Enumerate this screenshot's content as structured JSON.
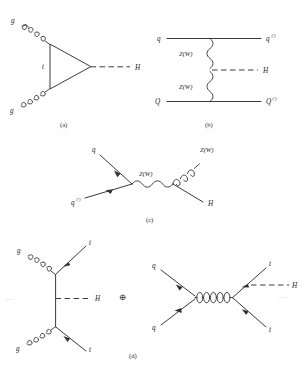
{
  "figure": {
    "background_color": "#ffffff",
    "line_color": "#303030",
    "text_color": "#262626",
    "width": 307,
    "height": 376
  },
  "panels": [
    {
      "id": "a",
      "caption": "(a)",
      "process": "gluon-gluon fusion via top quark loop",
      "labels": {
        "in_top": "g",
        "in_bottom": "g",
        "loop": "t",
        "out": "H"
      }
    },
    {
      "id": "b",
      "caption": "(b)",
      "process": "vector boson fusion",
      "labels": {
        "in_top": "q",
        "in_bottom": "Q",
        "out_top": "q",
        "out_top_sup": "(')",
        "out_bottom": "Q",
        "out_bottom_sup": "(')",
        "propagator_top": "Z(W)",
        "propagator_bottom": "Z(W)",
        "out_higgs": "H"
      }
    },
    {
      "id": "c",
      "caption": "(c)",
      "process": "associated production with a vector boson (Higgs-strahlung)",
      "labels": {
        "in_top": "q",
        "in_bottom": "q",
        "in_bottom_sup": "(')",
        "propagator": "Z(W)",
        "out_boson": "Z(W)",
        "out_higgs": "H"
      }
    },
    {
      "id": "d",
      "caption": "(d)",
      "process": "associated production with a top quark pair",
      "combiner": "⊕",
      "left": {
        "in_top": "g",
        "in_bottom": "g",
        "out_top": "t",
        "out_bottom": "t",
        "out_higgs": "H",
        "leading_ellipsis": "..."
      },
      "right": {
        "in_top": "q",
        "in_bottom": "q",
        "out_top": "t",
        "out_bottom": "t",
        "out_higgs": "H",
        "trailing_ellipsis": "..."
      }
    }
  ]
}
